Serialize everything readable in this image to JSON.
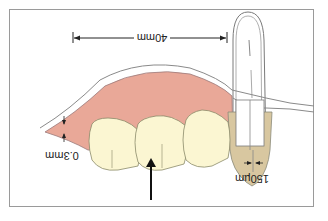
{
  "diagram": {
    "orientation": "rotated-180",
    "labels": {
      "span": "40mm",
      "gingiva_thickness": "0.3mm",
      "margin_gap": "150µm"
    },
    "colors": {
      "gingiva": "#e9a898",
      "tooth": "#fbf6d2",
      "crown": "#d8c7a0",
      "outline": "#7a7a7a",
      "frame": "#9a9a9a",
      "arrow": "#111111"
    }
  }
}
